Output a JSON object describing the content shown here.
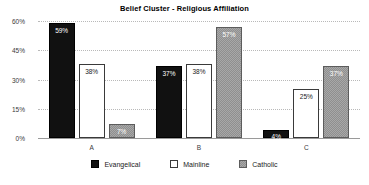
{
  "chart_data": {
    "type": "bar",
    "title": "Belief Cluster - Religious Affiliation",
    "xlabel": "",
    "ylabel": "",
    "categories": [
      "A",
      "B",
      "C"
    ],
    "series": [
      {
        "name": "Evangelical",
        "color": "#111111",
        "values": [
          59,
          37,
          4
        ],
        "labels": [
          "59%",
          "37%",
          "4%"
        ]
      },
      {
        "name": "Mainline",
        "color": "#ffffff",
        "values": [
          38,
          38,
          25
        ],
        "labels": [
          "38%",
          "38%",
          "25%"
        ]
      },
      {
        "name": "Catholic",
        "color": "#8f8f8f",
        "values": [
          7,
          57,
          37
        ],
        "labels": [
          "7%",
          "57%",
          "37%"
        ]
      }
    ],
    "ylim": [
      0,
      60
    ],
    "yticks": [
      0,
      15,
      30,
      45,
      60
    ],
    "ytick_labels": [
      "0%",
      "15%",
      "30%",
      "45%",
      "60%"
    ],
    "grid": true,
    "legend_position": "bottom"
  }
}
